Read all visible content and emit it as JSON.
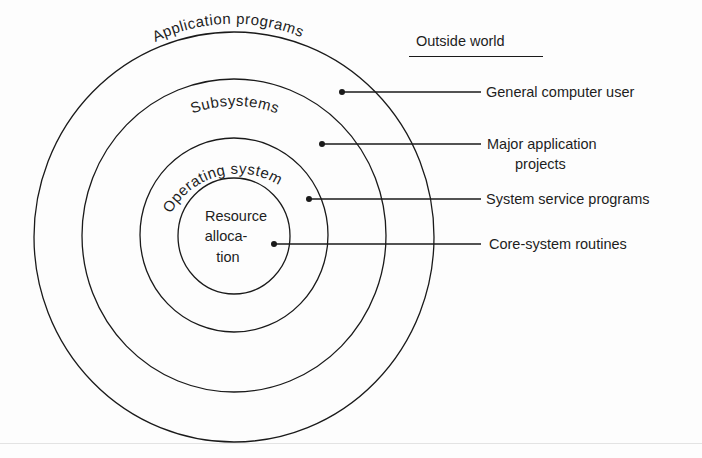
{
  "diagram": {
    "type": "concentric-layers",
    "heading": "Outside world",
    "layers": [
      {
        "id": "application-programs",
        "label": "Application programs",
        "level": 1,
        "audience": "General computer user"
      },
      {
        "id": "subsystems",
        "label": "Subsystems",
        "level": 2,
        "audience_lines": [
          "Major application",
          "projects"
        ]
      },
      {
        "id": "operating-system",
        "label": "Operating system",
        "level": 3,
        "audience": "System service programs"
      },
      {
        "id": "resource-allocation",
        "label_lines": [
          "Resource",
          "alloca-",
          "tion"
        ],
        "level": 4,
        "audience": "Core-system routines"
      }
    ],
    "colors": {
      "ink": "#1a1a1a",
      "background": "#fdfdfd"
    }
  }
}
